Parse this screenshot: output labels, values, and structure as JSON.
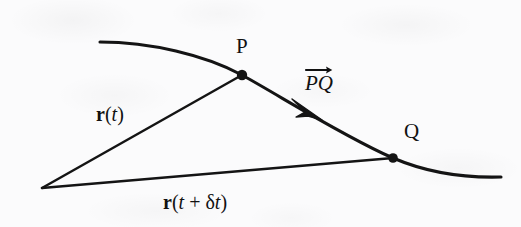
{
  "figure": {
    "background_color": "#fbfbfc",
    "ink_color": "#111111",
    "width": 521,
    "height": 227,
    "labels": {
      "point_p": "P",
      "point_q": "Q",
      "vector_pq_text": "PQ",
      "vector_pq_prefix": "P",
      "vector_pq_suffix": "Q",
      "r_t_bold": "r",
      "r_t_args": "(t)",
      "r_t_open": "(",
      "r_t_var": "t",
      "r_t_close": ")",
      "r_t_dt_bold": "r",
      "r_t_dt_open": "(",
      "r_t_dt_var": "t",
      "r_t_dt_plus": " + ",
      "r_t_dt_delta": "δ",
      "r_t_dt_var2": "t",
      "r_t_dt_close": ")"
    },
    "geometry": {
      "origin": [
        42,
        188
      ],
      "point_p": [
        242,
        75
      ],
      "point_q": [
        393,
        158
      ],
      "curve_start": [
        100,
        42
      ],
      "curve_end": [
        501,
        177
      ],
      "arrowhead_on_pq": [
        315,
        113
      ]
    }
  }
}
